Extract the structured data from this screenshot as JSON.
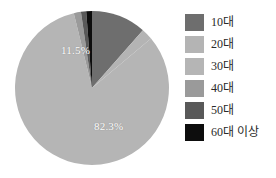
{
  "chart_data": {
    "type": "pie",
    "title": "",
    "categories": [
      "10대",
      "20대",
      "30대",
      "40대",
      "50대",
      "60대 이상"
    ],
    "values": [
      11.5,
      2.4,
      82.3,
      1.5,
      1.1,
      1.2
    ],
    "value_unit": "%",
    "visible_labels": [
      {
        "text": "11.5%",
        "category": "10대"
      },
      {
        "text": "82.3%",
        "category": "30대"
      }
    ],
    "colors": [
      "#6e6e6e",
      "#b4b4b4",
      "#b5b5b5",
      "#9a9a9a",
      "#595959",
      "#0d0d0d"
    ],
    "legend_position": "right",
    "start_angle_deg": 0,
    "direction": "clockwise",
    "grid": false,
    "background": "#ffffff"
  },
  "legend": {
    "items": [
      {
        "label": "10대",
        "color": "#6e6e6e"
      },
      {
        "label": "20대",
        "color": "#b4b4b4"
      },
      {
        "label": "30대",
        "color": "#b5b5b5"
      },
      {
        "label": "40대",
        "color": "#9a9a9a"
      },
      {
        "label": "50대",
        "color": "#595959"
      },
      {
        "label": "60대 이상",
        "color": "#0d0d0d"
      }
    ]
  },
  "labels": {
    "slice_minor": "11.5%",
    "slice_major": "82.3%"
  }
}
